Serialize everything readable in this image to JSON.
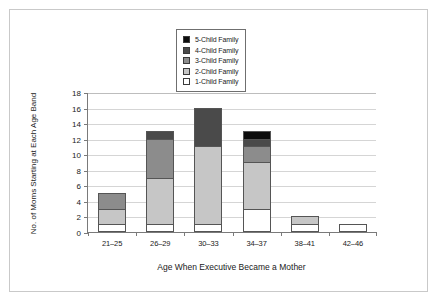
{
  "chart_data": {
    "type": "bar",
    "subtype": "stacked-bar",
    "title": "",
    "xlabel": "Age When Executive Became a Mother",
    "ylabel": "No. of Moms Starting at Each Age Band",
    "categories": [
      "21–25",
      "26–29",
      "30–33",
      "34–37",
      "38–41",
      "42–46"
    ],
    "series": [
      {
        "name": "1-Child Family",
        "color": "#ffffff",
        "values": [
          1,
          1,
          1,
          3,
          1,
          1
        ]
      },
      {
        "name": "2-Child Family",
        "color": "#c6c6c6",
        "values": [
          2,
          6,
          10,
          6,
          1,
          0
        ]
      },
      {
        "name": "3-Child Family",
        "color": "#8c8c8c",
        "values": [
          2,
          5,
          0,
          2,
          0,
          0
        ]
      },
      {
        "name": "4-Child Family",
        "color": "#4a4a4a",
        "values": [
          0,
          1,
          5,
          1,
          0,
          0
        ]
      },
      {
        "name": "5-Child Family",
        "color": "#0d0d0d",
        "values": [
          0,
          0,
          0,
          1,
          0,
          0
        ]
      }
    ],
    "totals": [
      5,
      13,
      16,
      12,
      2,
      1
    ],
    "ylim": [
      0,
      18
    ],
    "yticks": [
      0,
      2,
      4,
      6,
      8,
      10,
      12,
      14,
      16,
      18
    ],
    "grid": true,
    "legend_position": "top-center",
    "legend_order_top_to_bottom": [
      "5-Child Family",
      "4-Child Family",
      "3-Child Family",
      "2-Child Family",
      "1-Child Family"
    ]
  },
  "legend": {
    "items": [
      {
        "label": "5-Child Family",
        "color": "#0d0d0d"
      },
      {
        "label": "4-Child Family",
        "color": "#4a4a4a"
      },
      {
        "label": "3-Child Family",
        "color": "#8c8c8c"
      },
      {
        "label": "2-Child Family",
        "color": "#c6c6c6"
      },
      {
        "label": "1-Child Family",
        "color": "#ffffff"
      }
    ]
  },
  "axes": {
    "y_title": "No. of Moms Starting at Each Age Band",
    "x_title": "Age When Executive Became a Mother",
    "y_ticks": [
      "0",
      "2",
      "4",
      "6",
      "8",
      "10",
      "12",
      "14",
      "16",
      "18"
    ],
    "x_ticks": [
      "21–25",
      "26–29",
      "30–33",
      "34–37",
      "38–41",
      "42–46"
    ]
  }
}
